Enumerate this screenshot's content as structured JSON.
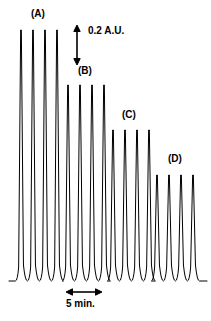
{
  "figure": {
    "type": "chromatogram",
    "background_color": "#ffffff",
    "trace_color": "#000000"
  },
  "labels": {
    "group_a": "(A)",
    "group_b": "(B)",
    "group_c": "(C)",
    "group_d": "(D)",
    "y_scale": "0.2 A.U.",
    "x_scale": "5 min."
  },
  "scales": {
    "y_scale_value": 0.2,
    "y_scale_units": "A.U.",
    "x_scale_value": 5,
    "x_scale_units": "min."
  },
  "chart_data": {
    "type": "line",
    "title": "",
    "xlabel": "",
    "ylabel": "",
    "grid": false,
    "legend_position": "none",
    "x_axis_scalebar": {
      "label": "5 min.",
      "value": 5,
      "units": "min.",
      "x_start": 66,
      "x_end": 102,
      "y": 292
    },
    "y_axis_scalebar": {
      "label": "0.2 A.U.",
      "value": 0.2,
      "units": "A.U.",
      "x": 77,
      "y_top": 25,
      "y_bottom": 65
    },
    "baseline_y": 281,
    "peak_width": 5.2,
    "groups": [
      {
        "name": "(A)",
        "label_x": 31,
        "label_y": 9,
        "peak_top_y": 30,
        "peak_height_px": 251,
        "relative_amplitude": 1.0,
        "peaks_x": [
          21,
          33,
          45,
          57
        ]
      },
      {
        "name": "(B)",
        "label_x": 78,
        "label_y": 66,
        "peak_top_y": 85,
        "peak_height_px": 196,
        "relative_amplitude": 0.78,
        "peaks_x": [
          68,
          80,
          92,
          104
        ]
      },
      {
        "name": "(C)",
        "label_x": 122,
        "label_y": 110,
        "peak_top_y": 130,
        "peak_height_px": 151,
        "relative_amplitude": 0.6,
        "peaks_x": [
          113,
          125,
          137,
          149
        ]
      },
      {
        "name": "(D)",
        "label_x": 168,
        "label_y": 154,
        "peak_top_y": 175,
        "peak_height_px": 106,
        "relative_amplitude": 0.42,
        "peaks_x": [
          157,
          169,
          181,
          193
        ]
      }
    ]
  }
}
